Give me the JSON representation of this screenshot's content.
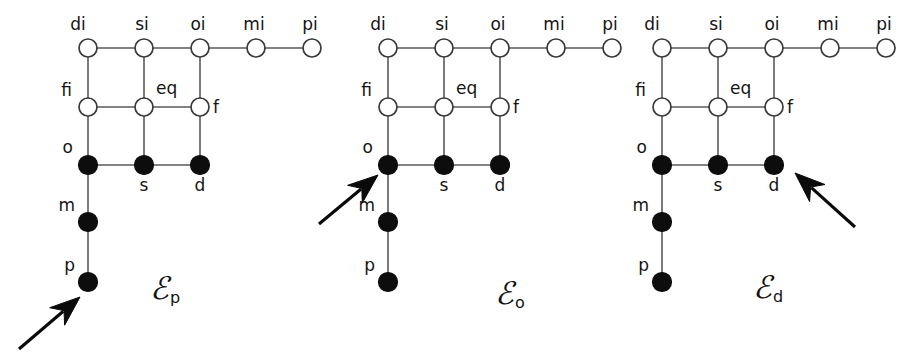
{
  "figure": {
    "width": 921,
    "height": 362,
    "background": "#ffffff",
    "edge_color": "#5a5a5a",
    "open_node_fill": "#ffffff",
    "open_node_stroke": "#3a3a3a",
    "filled_node_fill": "#0d0d0d",
    "arrow_color": "#0a0a0a"
  },
  "node_labels": {
    "di": "di",
    "si": "si",
    "oi": "oi",
    "mi": "mi",
    "pi": "pi",
    "fi": "fi",
    "eq": "eq",
    "f": "f",
    "o": "o",
    "s": "s",
    "d": "d",
    "m": "m",
    "p": "p"
  },
  "panels": [
    {
      "id": "panel-ep",
      "caption_base": "ℰ",
      "caption_sub": "p",
      "caption_text": "Ep",
      "caption_x": 150,
      "caption_y": 273,
      "origin_x": 88,
      "highlight": "p",
      "arrow": {
        "x1": 19,
        "y1": 349,
        "x2": 80,
        "y2": 297
      },
      "nodes": [
        {
          "name": "di",
          "label": "di",
          "col": 0,
          "row": 0,
          "type": "open",
          "label_dx": -10,
          "label_dy": -23,
          "anchor": "middle"
        },
        {
          "name": "si",
          "label": "si",
          "col": 1,
          "row": 0,
          "type": "open",
          "label_dx": -2,
          "label_dy": -23,
          "anchor": "middle"
        },
        {
          "name": "oi",
          "label": "oi",
          "col": 2,
          "row": 0,
          "type": "open",
          "label_dx": -2,
          "label_dy": -23,
          "anchor": "middle"
        },
        {
          "name": "mi",
          "label": "mi",
          "col": 3,
          "row": 0,
          "type": "open",
          "label_dx": -2,
          "label_dy": -23,
          "anchor": "middle"
        },
        {
          "name": "pi",
          "label": "pi",
          "col": 4,
          "row": 0,
          "type": "open",
          "label_dx": -2,
          "label_dy": -23,
          "anchor": "middle"
        },
        {
          "name": "fi",
          "label": "fi",
          "col": 0,
          "row": 1,
          "type": "open",
          "label_dx": -16,
          "label_dy": -16,
          "anchor": "end"
        },
        {
          "name": "eq",
          "label": "eq",
          "col": 1,
          "row": 1,
          "type": "open",
          "label_dx": 12,
          "label_dy": -18,
          "anchor": "start"
        },
        {
          "name": "f",
          "label": "f",
          "col": 2,
          "row": 1,
          "type": "open",
          "label_dx": 13,
          "label_dy": 1,
          "anchor": "start"
        },
        {
          "name": "o",
          "label": "o",
          "col": 0,
          "row": 2,
          "type": "filled",
          "label_dx": -15,
          "label_dy": -17,
          "anchor": "end"
        },
        {
          "name": "s",
          "label": "s",
          "col": 1,
          "row": 2,
          "type": "filled",
          "label_dx": 0,
          "label_dy": 21,
          "anchor": "middle"
        },
        {
          "name": "d",
          "label": "d",
          "col": 2,
          "row": 2,
          "type": "filled",
          "label_dx": 0,
          "label_dy": 21,
          "anchor": "middle"
        },
        {
          "name": "m",
          "label": "m",
          "col": 0,
          "row": 3,
          "type": "filled",
          "label_dx": -13,
          "label_dy": -16,
          "anchor": "end"
        },
        {
          "name": "p",
          "label": "p",
          "col": 0,
          "row": 4,
          "type": "filled",
          "label_dx": -13,
          "label_dy": -16,
          "anchor": "end"
        }
      ]
    },
    {
      "id": "panel-eo",
      "caption_base": "ℰ",
      "caption_sub": "o",
      "caption_text": "Eo",
      "caption_x": 495,
      "caption_y": 278,
      "origin_x": 388,
      "highlight": "o",
      "arrow": {
        "x1": 319,
        "y1": 224,
        "x2": 378,
        "y2": 175
      },
      "nodes": [
        {
          "name": "di",
          "label": "di",
          "col": 0,
          "row": 0,
          "type": "open",
          "label_dx": -10,
          "label_dy": -23,
          "anchor": "middle"
        },
        {
          "name": "si",
          "label": "si",
          "col": 1,
          "row": 0,
          "type": "open",
          "label_dx": -2,
          "label_dy": -23,
          "anchor": "middle"
        },
        {
          "name": "oi",
          "label": "oi",
          "col": 2,
          "row": 0,
          "type": "open",
          "label_dx": -2,
          "label_dy": -23,
          "anchor": "middle"
        },
        {
          "name": "mi",
          "label": "mi",
          "col": 3,
          "row": 0,
          "type": "open",
          "label_dx": -2,
          "label_dy": -23,
          "anchor": "middle"
        },
        {
          "name": "pi",
          "label": "pi",
          "col": 4,
          "row": 0,
          "type": "open",
          "label_dx": -2,
          "label_dy": -23,
          "anchor": "middle"
        },
        {
          "name": "fi",
          "label": "fi",
          "col": 0,
          "row": 1,
          "type": "open",
          "label_dx": -16,
          "label_dy": -16,
          "anchor": "end"
        },
        {
          "name": "eq",
          "label": "eq",
          "col": 1,
          "row": 1,
          "type": "open",
          "label_dx": 12,
          "label_dy": -18,
          "anchor": "start"
        },
        {
          "name": "f",
          "label": "f",
          "col": 2,
          "row": 1,
          "type": "open",
          "label_dx": 13,
          "label_dy": 1,
          "anchor": "start"
        },
        {
          "name": "o",
          "label": "o",
          "col": 0,
          "row": 2,
          "type": "filled",
          "label_dx": -15,
          "label_dy": -17,
          "anchor": "end"
        },
        {
          "name": "s",
          "label": "s",
          "col": 1,
          "row": 2,
          "type": "filled",
          "label_dx": 0,
          "label_dy": 21,
          "anchor": "middle"
        },
        {
          "name": "d",
          "label": "d",
          "col": 2,
          "row": 2,
          "type": "filled",
          "label_dx": 0,
          "label_dy": 21,
          "anchor": "middle"
        },
        {
          "name": "m",
          "label": "m",
          "col": 0,
          "row": 3,
          "type": "filled",
          "label_dx": -13,
          "label_dy": -16,
          "anchor": "end"
        },
        {
          "name": "p",
          "label": "p",
          "col": 0,
          "row": 4,
          "type": "filled",
          "label_dx": -13,
          "label_dy": -16,
          "anchor": "end"
        }
      ]
    },
    {
      "id": "panel-ed",
      "caption_base": "ℰ",
      "caption_sub": "d",
      "caption_text": "Ed",
      "caption_x": 753,
      "caption_y": 272,
      "origin_x": 662,
      "highlight": "d",
      "arrow": {
        "x1": 855,
        "y1": 227,
        "x2": 795,
        "y2": 173
      },
      "nodes": [
        {
          "name": "di",
          "label": "di",
          "col": 0,
          "row": 0,
          "type": "open",
          "label_dx": -10,
          "label_dy": -23,
          "anchor": "middle"
        },
        {
          "name": "si",
          "label": "si",
          "col": 1,
          "row": 0,
          "type": "open",
          "label_dx": -2,
          "label_dy": -23,
          "anchor": "middle"
        },
        {
          "name": "oi",
          "label": "oi",
          "col": 2,
          "row": 0,
          "type": "open",
          "label_dx": -2,
          "label_dy": -23,
          "anchor": "middle"
        },
        {
          "name": "mi",
          "label": "mi",
          "col": 3,
          "row": 0,
          "type": "open",
          "label_dx": -2,
          "label_dy": -23,
          "anchor": "middle"
        },
        {
          "name": "pi",
          "label": "pi",
          "col": 4,
          "row": 0,
          "type": "open",
          "label_dx": -2,
          "label_dy": -23,
          "anchor": "middle"
        },
        {
          "name": "fi",
          "label": "fi",
          "col": 0,
          "row": 1,
          "type": "open",
          "label_dx": -16,
          "label_dy": -16,
          "anchor": "end"
        },
        {
          "name": "eq",
          "label": "eq",
          "col": 1,
          "row": 1,
          "type": "open",
          "label_dx": 12,
          "label_dy": -18,
          "anchor": "start"
        },
        {
          "name": "f",
          "label": "f",
          "col": 2,
          "row": 1,
          "type": "open",
          "label_dx": 13,
          "label_dy": 1,
          "anchor": "start"
        },
        {
          "name": "o",
          "label": "o",
          "col": 0,
          "row": 2,
          "type": "filled",
          "label_dx": -15,
          "label_dy": -17,
          "anchor": "end"
        },
        {
          "name": "s",
          "label": "s",
          "col": 1,
          "row": 2,
          "type": "filled",
          "label_dx": 0,
          "label_dy": 21,
          "anchor": "middle"
        },
        {
          "name": "d",
          "label": "d",
          "col": 2,
          "row": 2,
          "type": "filled",
          "label_dx": 0,
          "label_dy": 21,
          "anchor": "middle"
        },
        {
          "name": "m",
          "label": "m",
          "col": 0,
          "row": 3,
          "type": "filled",
          "label_dx": -13,
          "label_dy": -16,
          "anchor": "end"
        },
        {
          "name": "p",
          "label": "p",
          "col": 0,
          "row": 4,
          "type": "filled",
          "label_dx": -13,
          "label_dy": -16,
          "anchor": "end"
        }
      ]
    }
  ],
  "geometry": {
    "col_step": 56,
    "row_y": [
      48,
      107,
      165,
      222,
      282
    ],
    "open_radius": 9,
    "filled_radius": 9.5
  },
  "edges": [
    [
      "di",
      "si"
    ],
    [
      "si",
      "oi"
    ],
    [
      "oi",
      "mi"
    ],
    [
      "mi",
      "pi"
    ],
    [
      "di",
      "fi"
    ],
    [
      "si",
      "eq"
    ],
    [
      "oi",
      "f"
    ],
    [
      "fi",
      "eq"
    ],
    [
      "eq",
      "f"
    ],
    [
      "fi",
      "o"
    ],
    [
      "eq",
      "s"
    ],
    [
      "f",
      "d"
    ],
    [
      "o",
      "s"
    ],
    [
      "s",
      "d"
    ],
    [
      "o",
      "m"
    ],
    [
      "m",
      "p"
    ]
  ]
}
